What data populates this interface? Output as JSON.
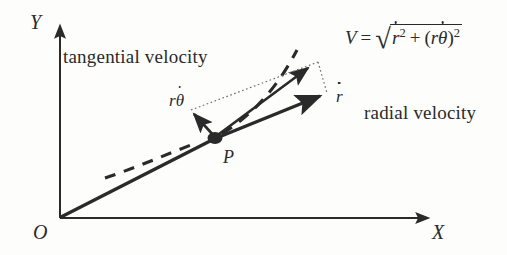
{
  "figure": {
    "background_color": "#fdfdfc",
    "ink_color": "#2a2a2a"
  },
  "axes": {
    "y_label": "Y",
    "x_label": "X",
    "origin_label": "O"
  },
  "point": {
    "label": "P"
  },
  "labels": {
    "tangential": "tangential velocity",
    "radial": "radial velocity"
  },
  "vectors": {
    "tangential_symbol_base": "r",
    "tangential_symbol_greek": "θ",
    "radial_symbol": "r"
  },
  "formula": {
    "magnitude_symbol": "V",
    "equals": "=",
    "radical": "√",
    "term1_base": "r",
    "term1_exp": "2",
    "plus": "+",
    "open_paren": "(",
    "term2_base": "r",
    "term2_greek": "θ",
    "close_paren": ")",
    "term2_exp": "2",
    "plain_text": "V = √( ṙ² + (rθ̇)² )"
  },
  "geometry": {
    "origin": [
      60,
      218
    ],
    "point_p": [
      215,
      138
    ],
    "v_tip": [
      312,
      66
    ],
    "rdot_tip": [
      324,
      98
    ],
    "rtheta_tip": [
      192,
      112
    ],
    "x_axis_end": [
      432,
      218
    ],
    "y_axis_top": [
      60,
      22
    ]
  }
}
